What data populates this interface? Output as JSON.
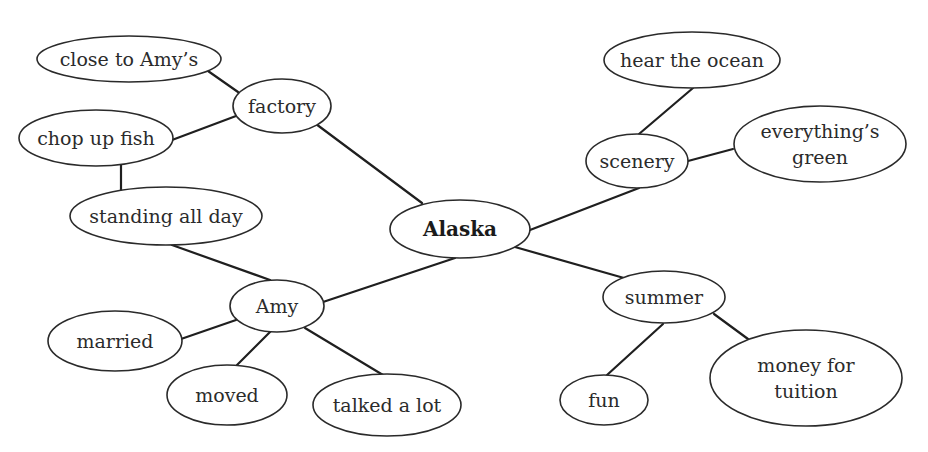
{
  "diagram": {
    "type": "cluster-map",
    "central_topic": "Alaska",
    "nodes": [
      {
        "id": "alaska",
        "label": [
          "Alaska"
        ],
        "cx": 460,
        "cy": 229,
        "rx": 70,
        "ry": 29,
        "bold": true
      },
      {
        "id": "factory",
        "label": [
          "factory"
        ],
        "cx": 282,
        "cy": 106,
        "rx": 49,
        "ry": 27
      },
      {
        "id": "close-to-amys",
        "label": [
          "close to Amy’s"
        ],
        "cx": 129,
        "cy": 59,
        "rx": 92,
        "ry": 23
      },
      {
        "id": "chop-up-fish",
        "label": [
          "chop up fish"
        ],
        "cx": 96,
        "cy": 138,
        "rx": 77,
        "ry": 28
      },
      {
        "id": "standing-all-day",
        "label": [
          "standing all day"
        ],
        "cx": 166,
        "cy": 216,
        "rx": 96,
        "ry": 29
      },
      {
        "id": "amy",
        "label": [
          "Amy"
        ],
        "cx": 277,
        "cy": 306,
        "rx": 47,
        "ry": 26
      },
      {
        "id": "married",
        "label": [
          "married"
        ],
        "cx": 115,
        "cy": 341,
        "rx": 67,
        "ry": 30
      },
      {
        "id": "moved",
        "label": [
          "moved"
        ],
        "cx": 227,
        "cy": 395,
        "rx": 60,
        "ry": 30
      },
      {
        "id": "talked-a-lot",
        "label": [
          "talked a lot"
        ],
        "cx": 387,
        "cy": 405,
        "rx": 74,
        "ry": 31
      },
      {
        "id": "scenery",
        "label": [
          "scenery"
        ],
        "cx": 637,
        "cy": 161,
        "rx": 51,
        "ry": 27
      },
      {
        "id": "hear-the-ocean",
        "label": [
          "hear the ocean"
        ],
        "cx": 692,
        "cy": 60,
        "rx": 88,
        "ry": 28
      },
      {
        "id": "everythings-green",
        "label": [
          "everything’s",
          "green"
        ],
        "cx": 820,
        "cy": 144,
        "rx": 86,
        "ry": 38
      },
      {
        "id": "summer",
        "label": [
          "summer"
        ],
        "cx": 664,
        "cy": 297,
        "rx": 61,
        "ry": 26
      },
      {
        "id": "fun",
        "label": [
          "fun"
        ],
        "cx": 604,
        "cy": 400,
        "rx": 44,
        "ry": 25
      },
      {
        "id": "money-for-tuition",
        "label": [
          "money for",
          "tuition"
        ],
        "cx": 806,
        "cy": 378,
        "rx": 96,
        "ry": 48
      }
    ],
    "edges": [
      {
        "from": "alaska",
        "to": "factory",
        "x1": 422,
        "y1": 203,
        "x2": 316,
        "y2": 124
      },
      {
        "from": "factory",
        "to": "close-to-amys",
        "x1": 238,
        "y1": 92,
        "x2": 208,
        "y2": 71
      },
      {
        "from": "factory",
        "to": "chop-up-fish",
        "x1": 236,
        "y1": 116,
        "x2": 172,
        "y2": 140
      },
      {
        "from": "chop-up-fish",
        "to": "standing-all-day",
        "x1": 121,
        "y1": 165,
        "x2": 121,
        "y2": 190
      },
      {
        "from": "standing-all-day",
        "to": "amy",
        "x1": 172,
        "y1": 245,
        "x2": 270,
        "y2": 280
      },
      {
        "from": "alaska",
        "to": "amy",
        "x1": 455,
        "y1": 258,
        "x2": 323,
        "y2": 302
      },
      {
        "from": "amy",
        "to": "married",
        "x1": 236,
        "y1": 320,
        "x2": 181,
        "y2": 339
      },
      {
        "from": "amy",
        "to": "moved",
        "x1": 270,
        "y1": 332,
        "x2": 237,
        "y2": 365
      },
      {
        "from": "amy",
        "to": "talked-a-lot",
        "x1": 305,
        "y1": 328,
        "x2": 383,
        "y2": 375
      },
      {
        "from": "alaska",
        "to": "scenery",
        "x1": 530,
        "y1": 230,
        "x2": 639,
        "y2": 188
      },
      {
        "from": "scenery",
        "to": "hear-the-ocean",
        "x1": 639,
        "y1": 134,
        "x2": 693,
        "y2": 88
      },
      {
        "from": "scenery",
        "to": "everythings-green",
        "x1": 688,
        "y1": 161,
        "x2": 733,
        "y2": 149
      },
      {
        "from": "alaska",
        "to": "summer",
        "x1": 515,
        "y1": 247,
        "x2": 624,
        "y2": 278
      },
      {
        "from": "summer",
        "to": "fun",
        "x1": 663,
        "y1": 324,
        "x2": 607,
        "y2": 375
      },
      {
        "from": "summer",
        "to": "money-for-tuition",
        "x1": 714,
        "y1": 314,
        "x2": 748,
        "y2": 339
      }
    ]
  }
}
